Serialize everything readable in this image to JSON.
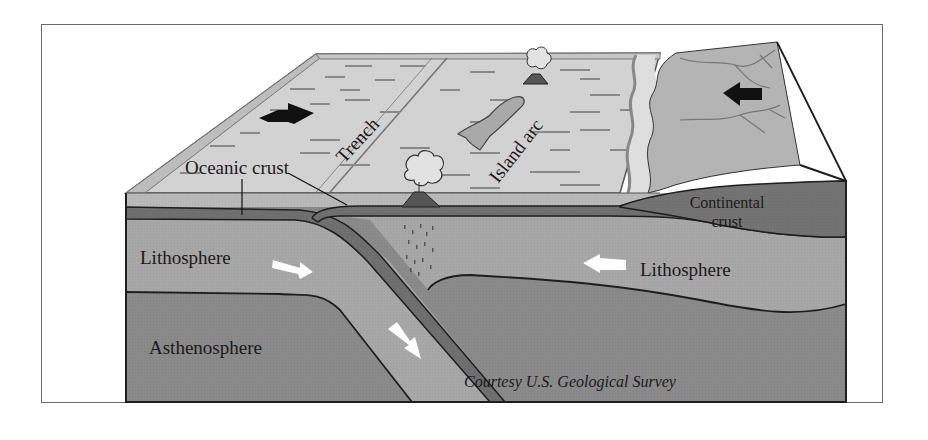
{
  "figure": {
    "type": "block diagram"
  },
  "labels": {
    "oceanic_crust": "Oceanic crust",
    "trench": "Trench",
    "island_arc": "Island arc",
    "continental_crust_line1": "Continental",
    "continental_crust_line2": "crust",
    "lithosphere_left": "Lithosphere",
    "lithosphere_right": "Lithosphere",
    "asthenosphere": "Asthenosphere",
    "credit": "Courtesy U.S. Geological Survey"
  },
  "arrows": {
    "surface_left_plate": "right",
    "surface_continent": "left",
    "lithosphere_left": "right",
    "lithosphere_right": "left",
    "subducting_slab": "down-right"
  },
  "colors": {
    "surface_ocean": "#d2d2d2",
    "continent_top": "#b4b4b4",
    "ocean_layer": "#b9b9b9",
    "crust_dark": "#6f6f6f",
    "lithosphere": "#a7a7a7",
    "asthenosphere": "#8a8a8a",
    "outline": "#1e1e1e",
    "arrow_dark": "#111111",
    "arrow_light": "#ffffff"
  }
}
